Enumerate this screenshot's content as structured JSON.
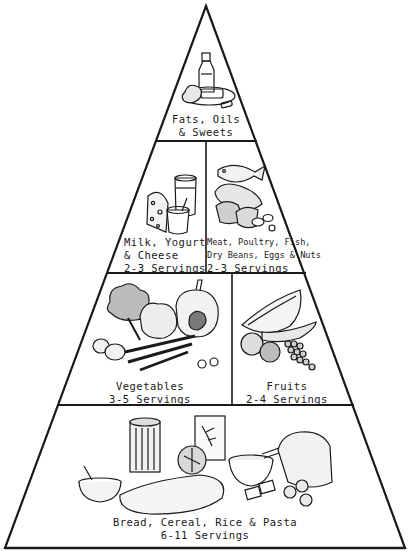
{
  "colors": {
    "ink": "#1a1a1a",
    "background": "#ffffff"
  },
  "tiers": [
    {
      "level": 1,
      "groups": [
        {
          "id": "fats",
          "name_lines": [
            "Fats, Oils",
            "& Sweets"
          ],
          "servings": "",
          "illustration": [
            "oil-bottle",
            "cake",
            "butter",
            "candy"
          ]
        }
      ]
    },
    {
      "level": 2,
      "groups": [
        {
          "id": "dairy",
          "name_lines": [
            "Milk, Yogurt",
            "& Cheese"
          ],
          "servings": "2-3 Servings",
          "illustration": [
            "cheese",
            "glass-of-milk",
            "yogurt-cup"
          ]
        },
        {
          "id": "protein",
          "name_lines": [
            "Meat, Poultry, Fish,",
            "Dry Beans, Eggs & Nuts"
          ],
          "servings": "2-3 Servings",
          "illustration": [
            "fish",
            "chicken",
            "meat",
            "eggs",
            "nuts"
          ]
        }
      ]
    },
    {
      "level": 3,
      "groups": [
        {
          "id": "vegetables",
          "name_lines": [
            "Vegetables"
          ],
          "servings": "3-5 Servings",
          "illustration": [
            "broccoli",
            "cabbage",
            "pumpkin",
            "potatoes",
            "carrots",
            "mushrooms"
          ]
        },
        {
          "id": "fruits",
          "name_lines": [
            "Fruits"
          ],
          "servings": "2-4 Servings",
          "illustration": [
            "watermelon",
            "bananas",
            "apple",
            "grapes"
          ]
        }
      ]
    },
    {
      "level": 4,
      "groups": [
        {
          "id": "grains",
          "name_lines": [
            "Bread, Cereal, Rice & Pasta"
          ],
          "servings": "6-11 Servings",
          "illustration": [
            "cereal-bowl",
            "pasta-jar",
            "cereal-box",
            "bread-loaf",
            "rice-bowl",
            "crackers",
            "rolls"
          ]
        }
      ]
    }
  ]
}
